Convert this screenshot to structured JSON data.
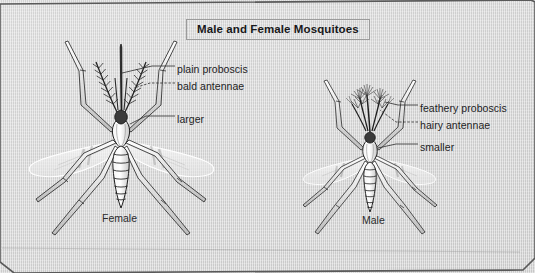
{
  "figure": {
    "title": "Male and Female Mosquitoes",
    "background_color": "#d7d7d7",
    "ink_color": "#1d1d1f",
    "border_color": "#4a4a4a"
  },
  "female": {
    "caption": "Female",
    "labels": [
      {
        "key": "plain_proboscis",
        "text": "plain proboscis"
      },
      {
        "key": "bald_antennae",
        "text": "bald antennae"
      },
      {
        "key": "size",
        "text": "larger"
      }
    ]
  },
  "male": {
    "caption": "Male",
    "labels": [
      {
        "key": "feathery_proboscis",
        "text": "feathery proboscis"
      },
      {
        "key": "hairy_antennae",
        "text": "hairy antennae"
      },
      {
        "key": "size",
        "text": "smaller"
      }
    ]
  }
}
